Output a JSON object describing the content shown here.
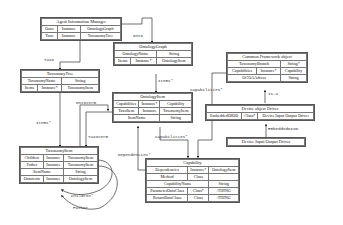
{
  "boxes": {
    "agent_info_manager": {
      "title": "Agent Information Manager",
      "rows": [
        [
          "Onto",
          "Instance",
          "OntologyGraph"
        ],
        [
          "Taxo",
          "Instance",
          "TaxonomyTree"
        ]
      ]
    },
    "taxonomy_tree": {
      "title": "TaxonomyTree",
      "rows2": [
        [
          "TaxonomyName",
          "String"
        ]
      ],
      "rows": [
        [
          "Items",
          "Instance*",
          "TaxonomyItem"
        ]
      ]
    },
    "taxonomy_item": {
      "title": "TaxonomyItem",
      "rows": [
        [
          "Children",
          "Instance",
          "TaxonomyItem"
        ],
        [
          "Father",
          "Instance",
          "TaxonomyItem"
        ]
      ],
      "rows2": [
        [
          "ItemName",
          "String"
        ]
      ],
      "rows3": [
        [
          "Ontoterm",
          "Instance",
          "OntologyItem"
        ]
      ]
    },
    "ontology_graph": {
      "title": "OntologyGraph",
      "rows2": [
        [
          "OntologyName",
          "String"
        ]
      ],
      "rows": [
        [
          "Items",
          "Instance*",
          "OntologyItem"
        ]
      ]
    },
    "ontology_item": {
      "title": "OntologyItem",
      "rows": [
        [
          "Capabilities",
          "Instance*",
          "Capability"
        ],
        [
          "TaxoItem",
          "Instance",
          "TaxonomyItem"
        ]
      ],
      "rows2": [
        [
          "ItemName",
          "String"
        ]
      ]
    },
    "capability": {
      "title": "Capability",
      "rows": [
        [
          "Dependencies",
          "Instance*",
          "OntologyItem"
        ],
        [
          "Method",
          "Class",
          ""
        ]
      ],
      "rows2": [
        [
          "CapabilityName",
          "String"
        ]
      ],
      "rows3": [
        [
          "ParameterDataClass",
          "Class*",
          ":THING"
        ],
        [
          "ReturnDataClass",
          "Class",
          ":THING"
        ]
      ]
    },
    "common_framework": {
      "title": "Common Framework object",
      "rows2": [
        [
          "TaxonomyBranch",
          "String*"
        ]
      ],
      "rows": [
        [
          "Capabilities",
          "Instance*",
          "Capability"
        ]
      ],
      "rows3": [
        [
          "OCOAAdress",
          "String"
        ]
      ]
    },
    "device_object_driver": {
      "title": "Device object Driver",
      "rows": [
        [
          "EmbeddedDIOD",
          "Class*",
          "Device Input Output Driver"
        ]
      ]
    },
    "device_io_driver": {
      "title": "Device Input Output Driver"
    }
  },
  "edge_labels": {
    "taxo": "Taxo",
    "onto": "Onto",
    "items_tax": "Items*",
    "items_onto": "Items*",
    "ontoterm": "Ontoterm",
    "taxoterm": "Taxoterm",
    "capabilities_onto": "Capabilities*",
    "capabilities_cfo": "Capabilities*",
    "dependencies": "Dependencies*",
    "is_a": "Is-a",
    "embedded_diod": "EmbeddedDIOD",
    "children": "Children*",
    "father": "Father"
  }
}
